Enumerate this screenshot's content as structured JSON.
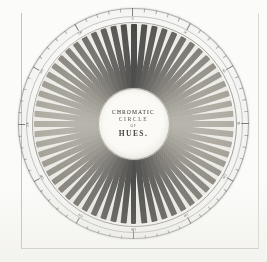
{
  "plate": {
    "title_lines": {
      "line1": "CHROMATIC",
      "line2": "CIRCLE",
      "line3": "OF",
      "line4": "HUES."
    },
    "medium": "engraved plate, grayscale reproduction",
    "shape": "radial color wheel"
  },
  "chart_data": {
    "type": "pie",
    "title": "CHROMATIC CIRCLE OF HUES.",
    "segment_count": 60,
    "hub_label": "CHROMATIC CIRCLE OF HUES.",
    "legend_position": "none",
    "grid": false,
    "axis_ring": {
      "units": "degrees",
      "range": [
        0,
        360
      ],
      "major_tick_every": 30,
      "minor_tick_every": 6,
      "labels": [
        "0",
        "30",
        "60",
        "90",
        "120",
        "150",
        "180",
        "210",
        "240",
        "270",
        "300",
        "330"
      ]
    },
    "categories": [
      "1",
      "2",
      "3",
      "4",
      "5",
      "6",
      "7",
      "8",
      "9",
      "10",
      "11",
      "12",
      "13",
      "14",
      "15",
      "16",
      "17",
      "18",
      "19",
      "20",
      "21",
      "22",
      "23",
      "24",
      "25",
      "26",
      "27",
      "28",
      "29",
      "30",
      "31",
      "32",
      "33",
      "34",
      "35",
      "36",
      "37",
      "38",
      "39",
      "40",
      "41",
      "42",
      "43",
      "44",
      "45",
      "46",
      "47",
      "48",
      "49",
      "50",
      "51",
      "52",
      "53",
      "54",
      "55",
      "56",
      "57",
      "58",
      "59",
      "60"
    ],
    "values": [
      6,
      6,
      6,
      6,
      6,
      6,
      6,
      6,
      6,
      6,
      6,
      6,
      6,
      6,
      6,
      6,
      6,
      6,
      6,
      6,
      6,
      6,
      6,
      6,
      6,
      6,
      6,
      6,
      6,
      6,
      6,
      6,
      6,
      6,
      6,
      6,
      6,
      6,
      6,
      6,
      6,
      6,
      6,
      6,
      6,
      6,
      6,
      6,
      6,
      6,
      6,
      6,
      6,
      6,
      6,
      6,
      6,
      6,
      6,
      6
    ],
    "segment_tones": [
      "#3a3a38",
      "#434341",
      "#4d4c49",
      "#565552",
      "#605e5a",
      "#6a6863",
      "#74716b",
      "#7d7a73",
      "#86837b",
      "#8f8c83",
      "#97948a",
      "#9e9b91",
      "#a5a197",
      "#aaa69c",
      "#aeaaa0",
      "#b0aca2",
      "#aeaaa0",
      "#aaa69c",
      "#a5a197",
      "#9e9b91",
      "#97948a",
      "#8f8c83",
      "#86837b",
      "#7d7a73",
      "#74716b",
      "#6a6863",
      "#605e5a",
      "#565552",
      "#4d4c49",
      "#434341",
      "#3a3a38",
      "#434341",
      "#4d4c49",
      "#565552",
      "#605e5a",
      "#6a6863",
      "#74716b",
      "#7d7a73",
      "#86837b",
      "#8f8c83",
      "#97948a",
      "#9e9b91",
      "#a5a197",
      "#aaa69c",
      "#aeaaa0",
      "#b0aca2",
      "#aeaaa0",
      "#aaa69c",
      "#a5a197",
      "#9e9b91",
      "#97948a",
      "#8f8c83",
      "#86837b",
      "#7d7a73",
      "#74716b",
      "#6a6863",
      "#605e5a",
      "#565552",
      "#4d4c49",
      "#434341"
    ],
    "xlabel": "",
    "ylabel": ""
  },
  "colors": {
    "paper": "#fbfbf9",
    "ink": "#4a4842",
    "ring_band": "#f2f1ec",
    "hub_face": "#faf9f4",
    "rule": "#b9b9b5"
  }
}
